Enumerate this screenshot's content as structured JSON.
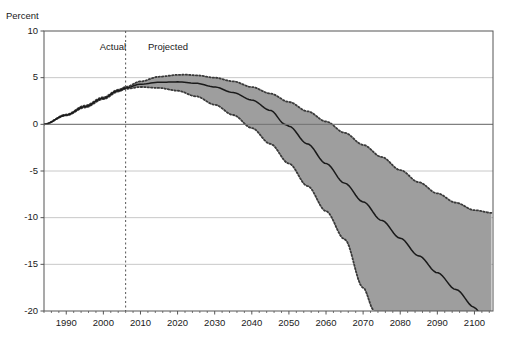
{
  "chart_data": {
    "type": "line",
    "title": "",
    "subtitle": "",
    "xlabel": "",
    "ylabel": "Percent",
    "xlim": [
      1984,
      2105
    ],
    "ylim": [
      -20,
      10
    ],
    "grid": true,
    "legend_position": "none",
    "xticks": [
      1990,
      2000,
      2010,
      2020,
      2030,
      2040,
      2050,
      2060,
      2070,
      2080,
      2090,
      2100
    ],
    "yticks": [
      10,
      5,
      0,
      -5,
      -10,
      -15,
      -20
    ],
    "annotations": [
      {
        "name": "actual-label",
        "text": "Actual",
        "x": 1999,
        "y": 8.2
      },
      {
        "name": "projected-label",
        "text": "Projected",
        "x": 2012,
        "y": 8.2
      },
      {
        "name": "divider",
        "text": "",
        "x": 2006,
        "style": "dashed-vertical"
      }
    ],
    "divider_year": 2006,
    "colors": {
      "band_fill": "#9e9e9e",
      "central_line": "#1a1a1a",
      "bound_line": "#3a3a3a",
      "axis": "#555555",
      "grid": "#c8c8c8",
      "background": "#ffffff"
    },
    "series": [
      {
        "name": "Central projection",
        "style": "solid",
        "x": [
          1984,
          1990,
          1995,
          2000,
          2004,
          2006,
          2010,
          2015,
          2020,
          2025,
          2030,
          2035,
          2040,
          2045,
          2049,
          2050,
          2055,
          2060,
          2065,
          2070,
          2075,
          2080,
          2085,
          2090,
          2095,
          2100,
          2101
        ],
        "values": [
          0.0,
          1.0,
          1.9,
          2.8,
          3.6,
          3.9,
          4.3,
          4.5,
          4.55,
          4.4,
          4.0,
          3.4,
          2.6,
          1.5,
          0.0,
          -0.2,
          -2.1,
          -4.2,
          -6.3,
          -8.3,
          -10.3,
          -12.2,
          -14.1,
          -15.9,
          -17.7,
          -19.6,
          -20.0
        ]
      },
      {
        "name": "Upper bound",
        "style": "dotted",
        "x": [
          1984,
          1990,
          1995,
          2000,
          2004,
          2006,
          2010,
          2015,
          2020,
          2022,
          2025,
          2030,
          2035,
          2040,
          2045,
          2050,
          2055,
          2060,
          2065,
          2070,
          2075,
          2080,
          2085,
          2090,
          2095,
          2100,
          2105
        ],
        "values": [
          0.0,
          1.05,
          2.0,
          2.9,
          3.7,
          4.0,
          4.6,
          5.1,
          5.3,
          5.32,
          5.25,
          5.0,
          4.6,
          4.0,
          3.3,
          2.4,
          1.4,
          0.3,
          -0.9,
          -2.2,
          -3.5,
          -4.9,
          -6.2,
          -7.4,
          -8.4,
          -9.2,
          -9.5
        ]
      },
      {
        "name": "Lower bound",
        "style": "dotted",
        "x": [
          1984,
          1990,
          1995,
          2000,
          2004,
          2006,
          2010,
          2015,
          2020,
          2025,
          2030,
          2035,
          2040,
          2045,
          2050,
          2055,
          2060,
          2065,
          2070,
          2073
        ],
        "values": [
          0.0,
          0.95,
          1.8,
          2.7,
          3.5,
          3.8,
          4.0,
          3.9,
          3.6,
          3.0,
          2.1,
          1.0,
          -0.4,
          -2.1,
          -4.2,
          -6.6,
          -9.3,
          -12.3,
          -17.5,
          -20.0
        ]
      }
    ]
  }
}
